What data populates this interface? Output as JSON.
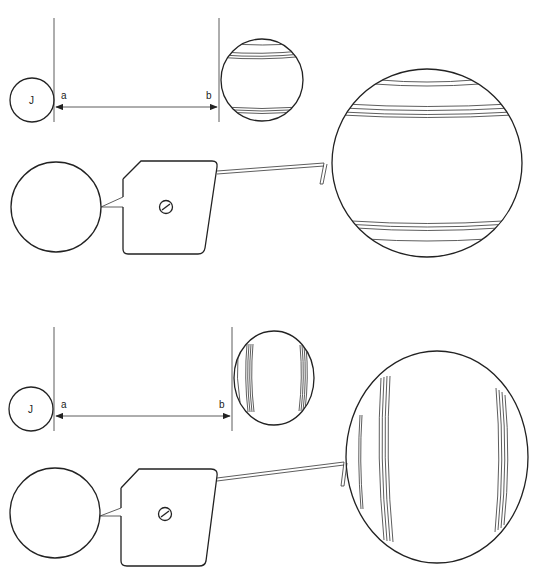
{
  "diagram": {
    "type": "telescope-observation-diagram",
    "panels": [
      {
        "id": "top",
        "small_body_label": "J",
        "label_a": "a",
        "label_b": "b",
        "planet_band_orientation": "horizontal",
        "description": "Small circle J, measured distance a-b, banded planet, observer eye, instrument with screw, long tube, magnified banded planet"
      },
      {
        "id": "bottom",
        "small_body_label": "J",
        "label_a": "a",
        "label_b": "b",
        "planet_band_orientation": "vertical",
        "description": "Same arrangement with planet bands rotated to vertical"
      }
    ]
  },
  "colors": {
    "line": "#222222",
    "background": "#ffffff"
  }
}
